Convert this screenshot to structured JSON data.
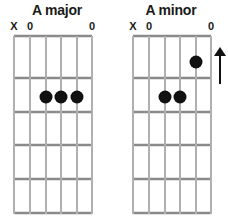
{
  "diagrams": [
    {
      "title": "A major",
      "open_markers": [
        {
          "string": 1,
          "label": "X"
        },
        {
          "string": 2,
          "label": "0"
        },
        {
          "string": 6,
          "label": "0"
        }
      ],
      "dots": [
        {
          "string": 3,
          "fret": 2
        },
        {
          "string": 4,
          "fret": 2
        },
        {
          "string": 5,
          "fret": 2
        }
      ]
    },
    {
      "title": "A minor",
      "open_markers": [
        {
          "string": 1,
          "label": "X"
        },
        {
          "string": 2,
          "label": "0"
        },
        {
          "string": 6,
          "label": "0"
        }
      ],
      "dots": [
        {
          "string": 5,
          "fret": 1
        },
        {
          "string": 3,
          "fret": 2
        },
        {
          "string": 4,
          "fret": 2
        }
      ],
      "annotation": "up-arrow"
    }
  ],
  "layout": {
    "strings": 6,
    "frets": 5
  },
  "colors": {
    "dot": "#111111",
    "fret": "#8a8a8a",
    "string": "#b5b5b5",
    "text": "#1a1a1a"
  }
}
